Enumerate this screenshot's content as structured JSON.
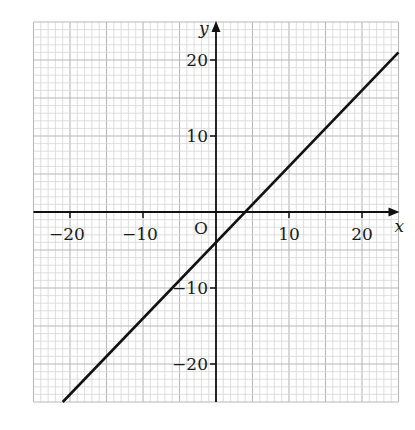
{
  "chart_data": {
    "type": "line",
    "title": "",
    "xlabel": "x",
    "ylabel": "y",
    "origin_label": "O",
    "xlim": [
      -25,
      25
    ],
    "ylim": [
      -25,
      25
    ],
    "grid": true,
    "grid_minor_step": 1,
    "grid_major_step": 5,
    "x_ticks": [
      -20,
      -10,
      10,
      20
    ],
    "y_ticks": [
      20,
      10,
      -10,
      -20
    ],
    "x_tick_labels": [
      "−20",
      "−10",
      "10",
      "20"
    ],
    "y_tick_labels": [
      "20",
      "10",
      "−10",
      "−20"
    ],
    "series": [
      {
        "name": "line",
        "equation": "y = x − 4",
        "slope": 1,
        "intercept": -4,
        "x": [
          -21,
          25
        ],
        "y": [
          -25,
          21
        ],
        "color": "#111111"
      }
    ],
    "x_intercept": 4,
    "y_intercept": -4
  }
}
